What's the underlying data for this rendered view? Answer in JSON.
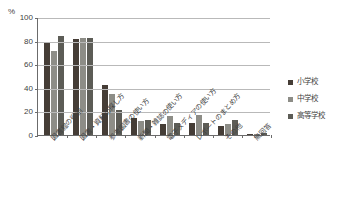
{
  "chart_data": {
    "type": "bar",
    "title": "",
    "xlabel": "",
    "ylabel": "%",
    "ylim": [
      0,
      100
    ],
    "yticks": [
      0,
      20,
      40,
      60,
      80,
      100
    ],
    "grid": true,
    "legend_position": "right",
    "categories": [
      "図書館の役割",
      "図書・資料の探し方",
      "参考図書の使い方",
      "新聞・雑誌の使い方",
      "電子メディアの使い方",
      "レポートのまとめ方",
      "その他",
      "無回答"
    ],
    "series": [
      {
        "name": "小学校",
        "color": "#453d36",
        "values": [
          78,
          81,
          42,
          14,
          9,
          10,
          8,
          1
        ]
      },
      {
        "name": "中学校",
        "color": "#8d8d87",
        "values": [
          71,
          82,
          35,
          12,
          16,
          17,
          9,
          1
        ]
      },
      {
        "name": "高等学校",
        "color": "#5c5c56",
        "values": [
          84,
          82,
          21,
          13,
          10,
          10,
          13,
          2
        ]
      }
    ]
  },
  "axis": {
    "unit_label": "%",
    "tick_labels": [
      "0",
      "20",
      "40",
      "60",
      "80",
      "100"
    ]
  }
}
